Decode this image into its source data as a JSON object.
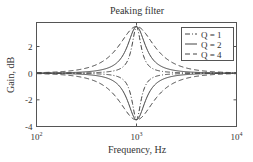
{
  "chart_data": {
    "type": "line",
    "title": "Peaking filter",
    "xlabel": "Frequency, Hz",
    "ylabel": "Gain, dB",
    "xscale": "log",
    "xlim": [
      100,
      10000
    ],
    "ylim": [
      -4,
      3.8
    ],
    "xticks": [
      {
        "base": "10",
        "exp": "2"
      },
      {
        "base": "10",
        "exp": "3"
      },
      {
        "base": "10",
        "exp": "4"
      }
    ],
    "yticks": [
      "2",
      "0",
      "-2",
      "-4"
    ],
    "center_frequency": 1000,
    "peak_gain_db": 3.5,
    "legend_position": "upper right",
    "series": [
      {
        "name": "Q = 1",
        "style": "dash-dot",
        "q_shape": 4,
        "gains_db": [
          3.5,
          -3.5
        ]
      },
      {
        "name": "Q = 2",
        "style": "solid",
        "q_shape": 2,
        "gains_db": [
          3.5,
          -3.5
        ]
      },
      {
        "name": "Q = 4",
        "style": "dashed",
        "q_shape": 1,
        "gains_db": [
          3.5,
          -3.5
        ]
      }
    ]
  }
}
